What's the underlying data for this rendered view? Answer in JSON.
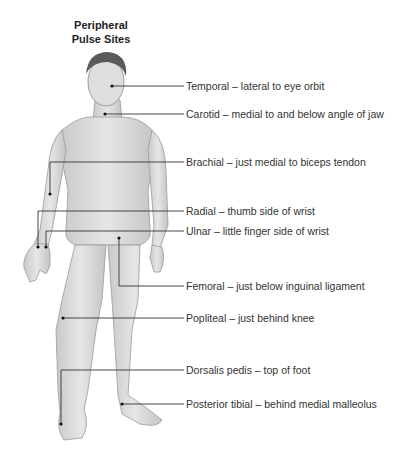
{
  "title": {
    "line1": "Peripheral",
    "line2": "Pulse Sites"
  },
  "pulse_sites": [
    {
      "name": "Temporal",
      "label": "Temporal – lateral to eye orbit",
      "y": 86
    },
    {
      "name": "Carotid",
      "label": "Carotid – medial to and below angle of jaw",
      "y": 114
    },
    {
      "name": "Brachial",
      "label": "Brachial – just medial to biceps tendon",
      "y": 162
    },
    {
      "name": "Radial",
      "label": "Radial – thumb side of wrist",
      "y": 211
    },
    {
      "name": "Ulnar",
      "label": "Ulnar – little finger side of wrist",
      "y": 231
    },
    {
      "name": "Femoral",
      "label": "Femoral – just below inguinal ligament",
      "y": 286
    },
    {
      "name": "Popliteal",
      "label": "Popliteal – just behind knee",
      "y": 318
    },
    {
      "name": "Dorsalis pedis",
      "label": "Dorsalis pedis – top of foot",
      "y": 370
    },
    {
      "name": "Posterior tibial",
      "label": "Posterior tibial – behind medial malleolus",
      "y": 404
    }
  ]
}
